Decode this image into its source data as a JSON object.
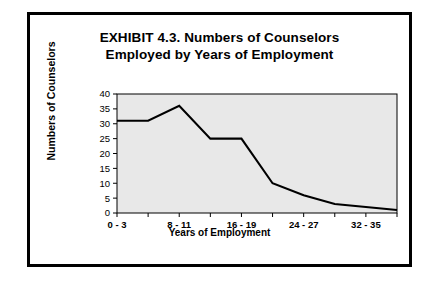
{
  "chart_data": {
    "type": "line",
    "title": "EXHIBIT 4.3.  Numbers of Counselors",
    "subtitle": "Employed by Years of Employment",
    "xlabel": "Years of Employment",
    "ylabel": "Numbers of Counselors",
    "categories": [
      "0 - 3",
      "4 - 7",
      "8 - 11",
      "12 - 15",
      "16 - 19",
      "20 - 23",
      "24 - 27",
      "28 - 31",
      "32 - 35",
      "36 - 39"
    ],
    "tick_labels": [
      "0 - 3",
      "",
      "8 - 11",
      "",
      "16 - 19",
      "",
      "24 - 27",
      "",
      "32 - 35",
      ""
    ],
    "values": [
      31,
      31,
      36,
      25,
      25,
      10,
      6,
      3,
      2,
      1
    ],
    "ylim": [
      0,
      40
    ],
    "yticks": [
      0,
      5,
      10,
      15,
      20,
      25,
      30,
      35,
      40
    ],
    "grid": false,
    "legend": "none",
    "plot_background": "#e8e8e8",
    "line_color": "#000000"
  }
}
